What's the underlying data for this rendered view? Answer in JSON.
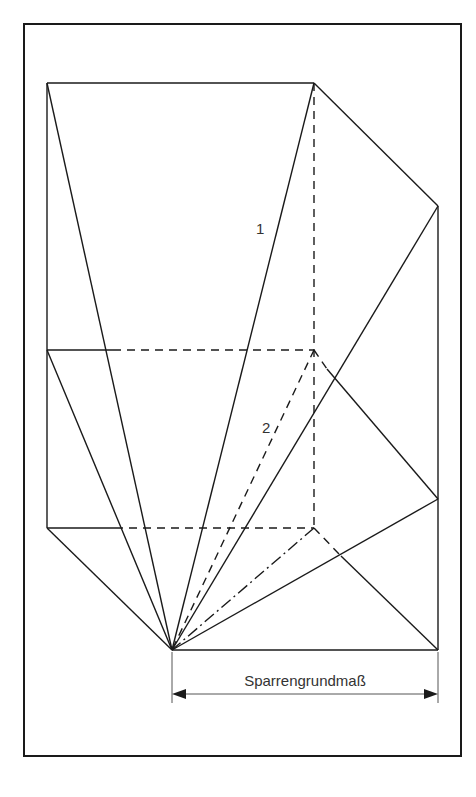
{
  "diagram": {
    "type": "roof rafter construction (hip roof development)",
    "labels": {
      "line_1": "1",
      "line_2": "2",
      "dimension": "Sparrengrundmaß"
    },
    "colors": {
      "stroke": "#1a1a1a",
      "background": "#ffffff",
      "text": "#333333"
    }
  }
}
